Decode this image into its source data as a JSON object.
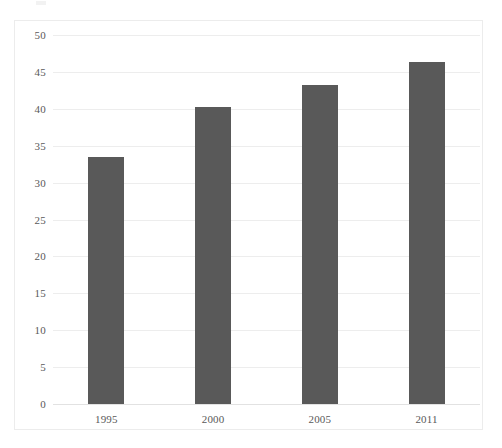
{
  "chart_data": {
    "type": "bar",
    "title": "",
    "subtitle": "",
    "xlabel": "",
    "ylabel": "",
    "categories": [
      "1995",
      "2000",
      "2005",
      "2011"
    ],
    "values": [
      33.5,
      40.2,
      43.2,
      46.3
    ],
    "series": [
      {
        "name": "",
        "values": [
          33.5,
          40.2,
          43.2,
          46.3
        ]
      }
    ],
    "ylim": [
      0,
      50
    ],
    "ytick_step": 5,
    "ytick_labels": [
      "0",
      "5",
      "10",
      "15",
      "20",
      "25",
      "30",
      "35",
      "40",
      "45",
      "50"
    ],
    "ytick_values": [
      0,
      5,
      10,
      15,
      20,
      25,
      30,
      35,
      40,
      45,
      50
    ],
    "grid": "horizontal",
    "legend": "none",
    "bar_color": "#595959",
    "gridline_color": "#ededed",
    "axis_text_color": "#595959",
    "frame_color": "#ececec",
    "background_color": "#ffffff",
    "bar_width_px": 36,
    "annotations": []
  }
}
